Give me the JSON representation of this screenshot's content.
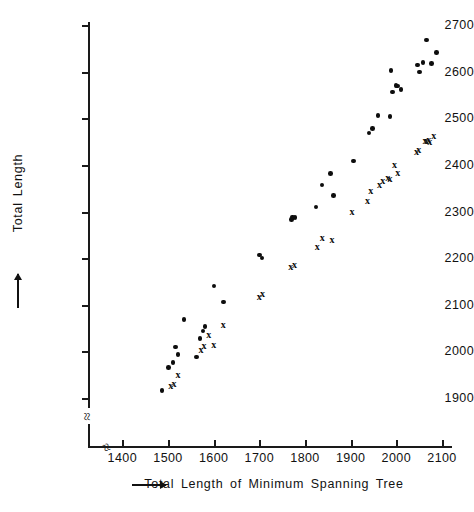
{
  "chart_data": {
    "type": "scatter",
    "title": "",
    "xlabel": "→ Total Length of Minimum Spanning Tree",
    "ylabel": "→ Total Length",
    "xlim": [
      1340,
      2130
    ],
    "ylim": [
      1860,
      2730
    ],
    "xticks": [
      1400,
      1500,
      1600,
      1700,
      1800,
      1900,
      2000,
      2100
    ],
    "yticks": [
      1900,
      2000,
      2100,
      2200,
      2300,
      2400,
      2500,
      2600,
      2700
    ],
    "grid": false,
    "legend": "none",
    "axis_breaks": [
      "x-axis break near origin",
      "y-axis break below 1900"
    ],
    "series": [
      {
        "name": "filled-circle",
        "marker": "dot",
        "color": "#0d0d0d",
        "points": [
          [
            1487,
            1916
          ],
          [
            1501,
            1965
          ],
          [
            1511,
            1976
          ],
          [
            1516,
            2009
          ],
          [
            1522,
            1993
          ],
          [
            1535,
            2068
          ],
          [
            1563,
            1988
          ],
          [
            1570,
            2027
          ],
          [
            1577,
            2044
          ],
          [
            1581,
            2053
          ],
          [
            1601,
            2140
          ],
          [
            1621,
            2106
          ],
          [
            1701,
            2207
          ],
          [
            1706,
            2200
          ],
          [
            1771,
            2283
          ],
          [
            1773,
            2288
          ],
          [
            1778,
            2287
          ],
          [
            1824,
            2310
          ],
          [
            1837,
            2357
          ],
          [
            1856,
            2381
          ],
          [
            1862,
            2334
          ],
          [
            1906,
            2408
          ],
          [
            1940,
            2468
          ],
          [
            1948,
            2478
          ],
          [
            1960,
            2506
          ],
          [
            1986,
            2504
          ],
          [
            1988,
            2602
          ],
          [
            1991,
            2556
          ],
          [
            1999,
            2570
          ],
          [
            2003,
            2569
          ],
          [
            2010,
            2562
          ],
          [
            2047,
            2614
          ],
          [
            2051,
            2599
          ],
          [
            2058,
            2620
          ],
          [
            2066,
            2668
          ],
          [
            2077,
            2618
          ],
          [
            2088,
            2641
          ]
        ]
      },
      {
        "name": "cross",
        "marker": "x",
        "color": "#0d0d0d",
        "points": [
          [
            1506,
            1926
          ],
          [
            1513,
            1931
          ],
          [
            1522,
            1950
          ],
          [
            1572,
            2005
          ],
          [
            1579,
            2013
          ],
          [
            1589,
            2037
          ],
          [
            1600,
            2015
          ],
          [
            1621,
            2058
          ],
          [
            1700,
            2117
          ],
          [
            1707,
            2124
          ],
          [
            1769,
            2181
          ],
          [
            1777,
            2186
          ],
          [
            1827,
            2226
          ],
          [
            1838,
            2245
          ],
          [
            1859,
            2241
          ],
          [
            1903,
            2299
          ],
          [
            1937,
            2324
          ],
          [
            1944,
            2345
          ],
          [
            1963,
            2358
          ],
          [
            1970,
            2366
          ],
          [
            1981,
            2373
          ],
          [
            1986,
            2370
          ],
          [
            1996,
            2400
          ],
          [
            2003,
            2384
          ],
          [
            2044,
            2429
          ],
          [
            2049,
            2434
          ],
          [
            2063,
            2452
          ],
          [
            2066,
            2453
          ],
          [
            2071,
            2455
          ],
          [
            2073,
            2451
          ],
          [
            2082,
            2464
          ]
        ]
      }
    ]
  },
  "axis": {
    "x_tick_labels": [
      "1400",
      "1500",
      "1600",
      "1700",
      "1800",
      "1900",
      "2000",
      "2100"
    ],
    "y_tick_labels": [
      "2700",
      "2600",
      "2500",
      "2400",
      "2300",
      "2200",
      "2100",
      "2000",
      "1900"
    ],
    "x_title": "→ Total  Length  of  Minimum  Spanning  Tree",
    "x_title_text": "Total  Length  of  Minimum  Spanning  Tree",
    "y_title_text": "Total  Length",
    "break_symbol": "≈"
  }
}
